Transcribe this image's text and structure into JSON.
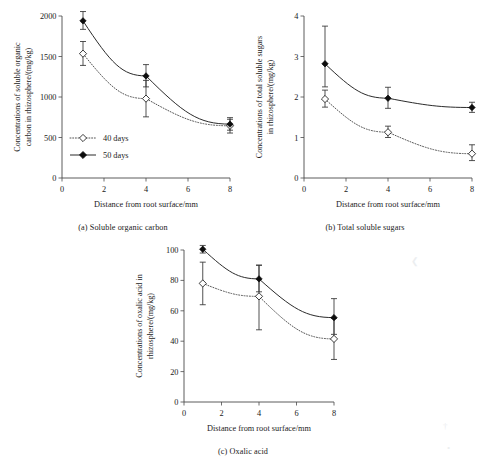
{
  "figure": {
    "shared_xlabel": "Distance from root surface/mm",
    "legend": [
      {
        "label": "40 days",
        "marker": "open-diamond",
        "line": "dotted"
      },
      {
        "label": "50 days",
        "marker": "filled-diamond",
        "line": "solid"
      }
    ],
    "colors": {
      "line_50_days": "#2b2b2b",
      "line_40_days": "#555555",
      "marker_filled": "#0d0d0d",
      "marker_open_fill": "#ffffff",
      "axis": "#4a4a4a"
    }
  },
  "chart_data": [
    {
      "id": "a",
      "type": "line",
      "title": "(a) Soluble organic carbon",
      "caption": "(a) Soluble organic carbon",
      "xlabel": "Distance from root surface/mm",
      "ylabel": "Concentrations of soluble organic carbon in rhizosphere/(mg/kg)",
      "ylabel_line1": "Concentrations of soluble organic",
      "ylabel_line2": "carbon in rhizosphere/(mg/kg)",
      "x": [
        1,
        4,
        8
      ],
      "xlim": [
        0,
        8
      ],
      "ylim": [
        0,
        2000
      ],
      "xticks": [
        0,
        2,
        4,
        6,
        8
      ],
      "yticks": [
        0,
        500,
        1000,
        1500,
        2000
      ],
      "grid": false,
      "legend_position": "lower-left-inside",
      "series": [
        {
          "name": "40 days",
          "values": [
            1535,
            980,
            645
          ],
          "err_low": [
            145,
            225,
            90
          ],
          "err_high": [
            150,
            225,
            80
          ],
          "marker": "open-diamond",
          "line": "dotted"
        },
        {
          "name": "50 days",
          "values": [
            1940,
            1260,
            665
          ],
          "err_low": [
            105,
            135,
            75
          ],
          "err_high": [
            115,
            140,
            80
          ],
          "marker": "filled-diamond",
          "line": "solid"
        }
      ]
    },
    {
      "id": "b",
      "type": "line",
      "title": "(b) Total soluble sugars",
      "caption": "(b) Total soluble sugars",
      "xlabel": "Distance from root surface/mm",
      "ylabel": "Concentrations of total soluble sugars in rhizosphere/(mg/kg)",
      "ylabel_line1": "Concentrations of  total soluble sugars",
      "ylabel_line2": "in rhizosphere/(mg/kg)",
      "x": [
        1,
        4,
        8
      ],
      "xlim": [
        0,
        8
      ],
      "ylim": [
        0,
        4
      ],
      "xticks": [
        0,
        2,
        4,
        6,
        8
      ],
      "yticks": [
        0,
        1,
        2,
        3,
        4
      ],
      "grid": false,
      "legend_position": "none",
      "series": [
        {
          "name": "40 days",
          "values": [
            1.95,
            1.13,
            0.6
          ],
          "err_low": [
            0.2,
            0.13,
            0.17
          ],
          "err_high": [
            0.22,
            0.15,
            0.22
          ],
          "marker": "open-diamond",
          "line": "dotted"
        },
        {
          "name": "50 days",
          "values": [
            2.82,
            1.97,
            1.74
          ],
          "err_low": [
            0.57,
            0.25,
            0.12
          ],
          "err_high": [
            0.93,
            0.27,
            0.13
          ],
          "marker": "filled-diamond",
          "line": "solid"
        }
      ]
    },
    {
      "id": "c",
      "type": "line",
      "title": "(c) Oxalic acid",
      "caption": "(c) Oxalic acid",
      "xlabel": "Distance from root surface/mm",
      "ylabel": "Concentrations of oxalic acid in rhizosphere/(mg/kg)",
      "ylabel_line1": "Concentrations of  oxalic acid in",
      "ylabel_line2": "rhizosphere/(mg/kg)",
      "x": [
        1,
        4,
        8
      ],
      "xlim": [
        0,
        8
      ],
      "ylim": [
        0,
        100
      ],
      "xticks": [
        0,
        2,
        4,
        6,
        8
      ],
      "yticks": [
        0,
        20,
        40,
        60,
        80,
        100
      ],
      "grid": false,
      "legend_position": "none",
      "series": [
        {
          "name": "40 days",
          "values": [
            78,
            69.5,
            41.5
          ],
          "err_low": [
            14,
            22,
            13.5
          ],
          "err_high": [
            14,
            20.5,
            13.5
          ],
          "marker": "open-diamond",
          "line": "dotted"
        },
        {
          "name": "50 days",
          "values": [
            100.5,
            81,
            55.5
          ],
          "err_low": [
            2.5,
            8.5,
            11
          ],
          "err_high": [
            2.5,
            9,
            12.5
          ],
          "marker": "filled-diamond",
          "line": "solid"
        }
      ]
    }
  ]
}
